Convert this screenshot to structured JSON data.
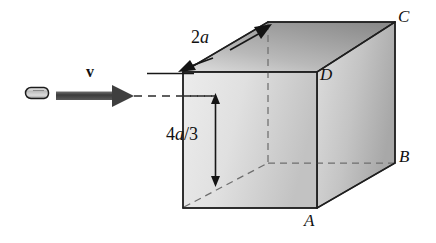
{
  "figure": {
    "type": "physics-diagram",
    "canvas": {
      "width": 436,
      "height": 243,
      "background": "#ffffff"
    }
  },
  "labels": {
    "corner_c": "C",
    "corner_d": "D",
    "corner_b": "B",
    "corner_a": "A",
    "velocity": "v",
    "edge_dimension": "2a",
    "edge_dimension_value": "2a",
    "height_dimension_numerator": "4a",
    "height_dimension_slash": "/",
    "height_dimension_denominator": "3",
    "height_dimension": "4a/3"
  },
  "geometry": {
    "front_face": [
      [
        183,
        72
      ],
      [
        317,
        72
      ],
      [
        317,
        208
      ],
      [
        183,
        208
      ]
    ],
    "top_face": [
      [
        183,
        72
      ],
      [
        268,
        22
      ],
      [
        395,
        22
      ],
      [
        317,
        72
      ]
    ],
    "right_face": [
      [
        317,
        72
      ],
      [
        395,
        22
      ],
      [
        395,
        163
      ],
      [
        317,
        208
      ]
    ],
    "hidden_edges": [
      [
        [
          268,
          22
        ],
        [
          268,
          163
        ]
      ],
      [
        [
          183,
          208
        ],
        [
          268,
          163
        ]
      ],
      [
        [
          268,
          163
        ],
        [
          395,
          163
        ]
      ]
    ],
    "trajectory_line": [
      [
        132,
        96
      ],
      [
        215,
        96
      ]
    ],
    "velocity_arrow": [
      [
        55,
        96
      ],
      [
        132,
        96
      ]
    ],
    "bullet": {
      "x": 30,
      "y": 87,
      "width": 22,
      "height": 11
    },
    "height_arrow": [
      [
        215,
        96
      ],
      [
        215,
        183
      ]
    ],
    "edge_arrow_upper": [
      [
        232,
        46
      ],
      [
        272,
        24
      ]
    ],
    "edge_arrow_lower": [
      [
        196,
        66
      ],
      [
        175,
        74
      ]
    ],
    "guide_line": [
      [
        148,
        74
      ],
      [
        192,
        74
      ]
    ]
  },
  "colors": {
    "stroke": "#1a1a1a",
    "front_face_light": "#e8e8e8",
    "front_face_dark": "#c6c6c6",
    "top_face_light": "#d4d4d4",
    "top_face_dark": "#8f8f8f",
    "right_face_light": "#d9d9d9",
    "right_face_dark": "#b0b0b0",
    "bullet_fill": "#d0d0d0",
    "arrow_fill": "#4a4a4a",
    "hidden_edge": "#6b6b6b"
  }
}
